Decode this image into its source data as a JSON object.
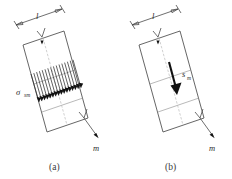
{
  "figure": {
    "type": "technical-diagram",
    "background_color": "#ffffff",
    "line_color": "#4a4a4a",
    "hatch_color": "#2e2e2e",
    "arrow_fill_color": "#111111",
    "panel_count": 2
  },
  "panels": [
    {
      "id": "a",
      "caption": "(a)",
      "dimension_label": "l",
      "stress_label_symbol": "σ",
      "stress_label_subscript": "sm",
      "force_label": "m",
      "middle_band": "hatched",
      "hatch_line_count": 16,
      "band_count": 3
    },
    {
      "id": "b",
      "caption": "(b)",
      "dimension_label": "l",
      "shear_label_symbol": "s",
      "shear_label_subscript": "m",
      "force_label": "m",
      "middle_band": "solid-arrow",
      "band_count": 3
    }
  ],
  "captions": {
    "panel_a": "(a)",
    "panel_b": "(b)"
  },
  "labels": {
    "length_a": "l",
    "length_b": "l",
    "sigma_symbol": "σ",
    "sigma_subscript": "sm",
    "s_symbol": "s",
    "s_subscript": "m",
    "mass_a": "m",
    "mass_b": "m"
  }
}
